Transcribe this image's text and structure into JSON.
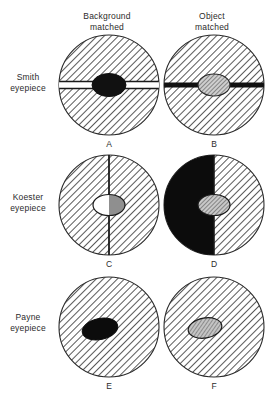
{
  "figure": {
    "type": "diagram",
    "column_headers": [
      {
        "id": "background-matched",
        "line1": "Background",
        "line2": "matched"
      },
      {
        "id": "object-matched",
        "line1": "Object",
        "line2": "matched"
      }
    ],
    "row_labels": [
      {
        "id": "smith",
        "line1": "Smith",
        "line2": "eyepiece"
      },
      {
        "id": "koester",
        "line1": "Koester",
        "line2": "eyepiece"
      },
      {
        "id": "payne",
        "line1": "Payne",
        "line2": "eyepiece"
      }
    ],
    "panels": [
      {
        "letter": "A",
        "row": "Smith eyepiece",
        "column": "Background matched",
        "field_fill": "hatched",
        "divider": "horizontal-light-band",
        "object_fill": "black",
        "object_position": "center"
      },
      {
        "letter": "B",
        "row": "Smith eyepiece",
        "column": "Object matched",
        "field_fill": "hatched",
        "divider": "horizontal-black-bar",
        "object_fill": "hatched-gray",
        "object_position": "center"
      },
      {
        "letter": "C",
        "row": "Koester eyepiece",
        "column": "Background matched",
        "field_fill": "hatched",
        "divider": "vertical-line",
        "object_fill": "split-white-gray",
        "object_position": "center"
      },
      {
        "letter": "D",
        "row": "Koester eyepiece",
        "column": "Object matched",
        "field_fill": "left-half-black-right-half-hatched",
        "divider": "vertical-line",
        "object_fill": "hatched-gray",
        "object_position": "center"
      },
      {
        "letter": "E",
        "row": "Payne eyepiece",
        "column": "Background matched",
        "field_fill": "hatched",
        "divider": "none",
        "object_fill": "black",
        "object_position": "left-of-center"
      },
      {
        "letter": "F",
        "row": "Payne eyepiece",
        "column": "Object matched",
        "field_fill": "hatched",
        "divider": "none",
        "object_fill": "hatched-gray",
        "object_position": "left-of-center"
      }
    ],
    "colors": {
      "ink": "#1a1a1a",
      "page": "#ffffff",
      "hatch_line": "#3c3c3c",
      "object_gray": "#9a9a9a",
      "object_black": "#111111"
    }
  }
}
